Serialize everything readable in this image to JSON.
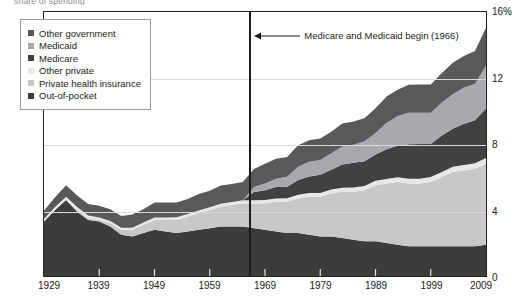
{
  "figure": {
    "top_caption_fragment": "share of spending",
    "annotation": {
      "text": "Medicare and Medicaid begin (1966)",
      "arrow_icon": "left-arrow-icon",
      "event_year": 1966
    }
  },
  "legend": {
    "position": "top-left",
    "items": [
      {
        "label": "Other government",
        "color": "#58595b"
      },
      {
        "label": "Medicaid",
        "color": "#a7a9ac"
      },
      {
        "label": "Medicare",
        "color": "#414042"
      },
      {
        "label": "Other private",
        "color": "#e6e7e8"
      },
      {
        "label": "Private health insurance",
        "color": "#c7c8ca"
      },
      {
        "label": "Out-of-pocket",
        "color": "#3b3c3e"
      }
    ]
  },
  "axes": {
    "y": {
      "ticks": [
        "0",
        "4",
        "8",
        "12",
        "16%"
      ],
      "values": [
        0,
        4,
        8,
        12,
        16
      ],
      "min": 0,
      "max": 16,
      "unit": "%"
    },
    "x": {
      "ticks": [
        "1929",
        "1939",
        "1949",
        "1959",
        "1969",
        "1979",
        "1989",
        "1999",
        "2009"
      ],
      "values": [
        1929,
        1939,
        1949,
        1959,
        1969,
        1979,
        1989,
        1999,
        2009
      ],
      "min": 1929,
      "max": 2009
    }
  },
  "chart_data": {
    "type": "area",
    "title": "",
    "subtitle": "",
    "xlabel": "",
    "ylabel": "",
    "xlim": [
      1929,
      2009
    ],
    "ylim": [
      0,
      16
    ],
    "grid": true,
    "gridlines_y": [
      4,
      8,
      12
    ],
    "legend_position": "top-left",
    "stacking": "stacked",
    "stack_order_bottom_to_top": [
      "Out-of-pocket",
      "Private health insurance",
      "Other private",
      "Medicare",
      "Medicaid",
      "Other government"
    ],
    "annotations": [
      {
        "text": "Medicare and Medicaid begin (1966)",
        "x": 1966,
        "type": "vertical-line-with-arrow"
      }
    ],
    "x": [
      1929,
      1931,
      1933,
      1935,
      1937,
      1939,
      1941,
      1943,
      1945,
      1947,
      1949,
      1951,
      1953,
      1955,
      1957,
      1959,
      1961,
      1963,
      1965,
      1967,
      1969,
      1971,
      1973,
      1975,
      1977,
      1979,
      1981,
      1983,
      1985,
      1987,
      1989,
      1991,
      1993,
      1995,
      1997,
      1999,
      2001,
      2003,
      2005,
      2007,
      2009
    ],
    "series": [
      {
        "name": "Out-of-pocket",
        "color": "#3b3c3e",
        "values": [
          3.3,
          4.0,
          4.6,
          3.9,
          3.4,
          3.3,
          3.0,
          2.5,
          2.4,
          2.6,
          2.8,
          2.7,
          2.6,
          2.7,
          2.8,
          2.9,
          3.0,
          3.0,
          3.0,
          2.9,
          2.8,
          2.7,
          2.6,
          2.6,
          2.5,
          2.4,
          2.4,
          2.3,
          2.2,
          2.1,
          2.1,
          2.0,
          1.9,
          1.8,
          1.8,
          1.8,
          1.8,
          1.8,
          1.8,
          1.8,
          1.9
        ]
      },
      {
        "name": "Private health insurance",
        "color": "#c7c8ca",
        "values": [
          0.0,
          0.0,
          0.0,
          0.1,
          0.1,
          0.1,
          0.2,
          0.3,
          0.4,
          0.5,
          0.6,
          0.7,
          0.8,
          0.9,
          1.0,
          1.1,
          1.2,
          1.3,
          1.4,
          1.5,
          1.6,
          1.8,
          1.9,
          2.1,
          2.3,
          2.4,
          2.6,
          2.8,
          2.9,
          3.1,
          3.4,
          3.6,
          3.8,
          3.8,
          3.8,
          3.9,
          4.2,
          4.5,
          4.6,
          4.7,
          4.9
        ]
      },
      {
        "name": "Other private",
        "color": "#e6e7e8",
        "values": [
          0.15,
          0.18,
          0.2,
          0.18,
          0.16,
          0.15,
          0.14,
          0.13,
          0.13,
          0.14,
          0.15,
          0.15,
          0.16,
          0.16,
          0.17,
          0.17,
          0.18,
          0.18,
          0.19,
          0.19,
          0.2,
          0.2,
          0.21,
          0.22,
          0.23,
          0.23,
          0.24,
          0.25,
          0.26,
          0.26,
          0.27,
          0.28,
          0.29,
          0.29,
          0.3,
          0.3,
          0.31,
          0.32,
          0.33,
          0.34,
          0.35
        ]
      },
      {
        "name": "Medicare",
        "color": "#414042",
        "values": [
          0,
          0,
          0,
          0,
          0,
          0,
          0,
          0,
          0,
          0,
          0,
          0,
          0,
          0,
          0,
          0,
          0,
          0,
          0,
          0.5,
          0.6,
          0.7,
          0.7,
          0.9,
          1.0,
          1.1,
          1.2,
          1.4,
          1.5,
          1.5,
          1.6,
          1.8,
          1.9,
          2.1,
          2.1,
          2.0,
          2.2,
          2.3,
          2.5,
          2.6,
          3.0
        ]
      },
      {
        "name": "Medicaid",
        "color": "#a7a9ac",
        "values": [
          0,
          0,
          0,
          0,
          0,
          0,
          0,
          0,
          0,
          0,
          0,
          0,
          0,
          0,
          0,
          0,
          0,
          0,
          0,
          0.3,
          0.4,
          0.5,
          0.6,
          0.8,
          0.9,
          0.9,
          1.0,
          1.1,
          1.1,
          1.2,
          1.3,
          1.6,
          1.8,
          1.9,
          1.9,
          1.9,
          2.0,
          2.1,
          2.2,
          2.2,
          2.6
        ]
      },
      {
        "name": "Other government",
        "color": "#58595b",
        "values": [
          0.5,
          0.6,
          0.7,
          0.7,
          0.7,
          0.7,
          0.7,
          0.7,
          0.8,
          0.8,
          0.9,
          0.9,
          0.9,
          0.9,
          1.0,
          1.0,
          1.1,
          1.1,
          1.1,
          1.1,
          1.2,
          1.2,
          1.2,
          1.3,
          1.3,
          1.3,
          1.3,
          1.4,
          1.4,
          1.4,
          1.5,
          1.6,
          1.6,
          1.7,
          1.7,
          1.7,
          1.8,
          1.9,
          1.9,
          2.0,
          2.3
        ]
      }
    ]
  }
}
